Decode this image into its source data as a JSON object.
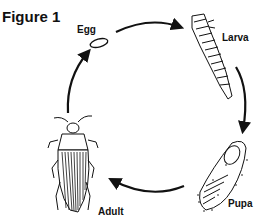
{
  "figure": {
    "title": "Figure 1",
    "stages": [
      {
        "label": "Egg"
      },
      {
        "label": "Larva"
      },
      {
        "label": "Pupa"
      },
      {
        "label": "Adult"
      }
    ]
  }
}
